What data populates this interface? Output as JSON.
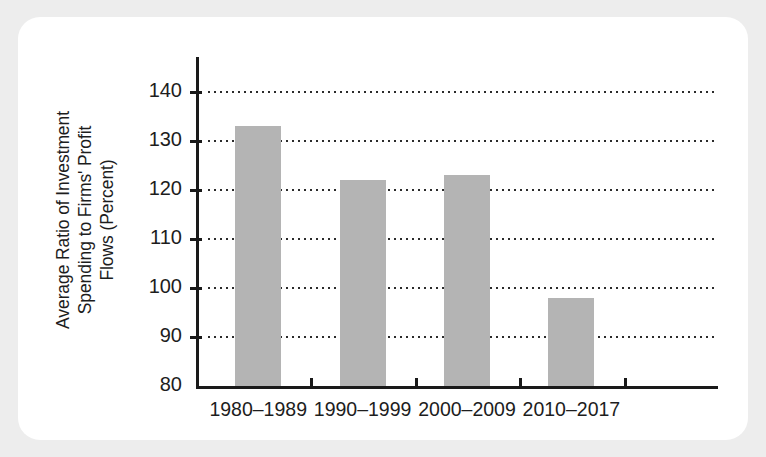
{
  "figure": {
    "background_color": "#ededed",
    "card_color": "#ffffff",
    "bar_color": "#b4b4b4",
    "axis_color": "#1a1a1a",
    "text_color": "#1d1d1d"
  },
  "y_axis_title_lines": [
    "Average Ratio of Investment",
    "Spending to Firms' Profit",
    "Flows (Percent)"
  ],
  "chart_data": {
    "type": "bar",
    "title": "",
    "subtitle": "",
    "xlabel": "",
    "ylabel": "Average Ratio of Investment Spending to Firms' Profit Flows (Percent)",
    "categories": [
      "1980–1989",
      "1990–1999",
      "2000–2009",
      "2010–2017"
    ],
    "values": [
      133,
      122,
      123,
      98
    ],
    "ylim": [
      80,
      140
    ],
    "ytick_labels": [
      "140",
      "130",
      "120",
      "110",
      "100",
      "90",
      "80"
    ],
    "ytick_values": [
      140,
      130,
      120,
      110,
      100,
      90,
      80
    ],
    "grid": "horizontal-dotted",
    "legend": "none",
    "annotations": []
  }
}
